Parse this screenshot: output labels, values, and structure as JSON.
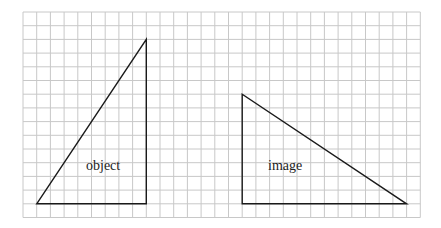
{
  "diagram": {
    "grid": {
      "origin_x": 23,
      "origin_y": 12,
      "cell": 13.7,
      "cols": 29,
      "rows": 15,
      "line_color": "#c8c8c8"
    },
    "shapes": [
      {
        "name": "object",
        "label": "object",
        "vertices_grid": [
          [
            1,
            14
          ],
          [
            9,
            2
          ],
          [
            9,
            14
          ]
        ],
        "label_pos": [
          86,
          170
        ]
      },
      {
        "name": "image",
        "label": "image",
        "vertices_grid": [
          [
            16,
            6
          ],
          [
            16,
            14
          ],
          [
            28,
            14
          ]
        ],
        "label_pos": [
          268,
          170
        ]
      }
    ],
    "stroke_color": "#1a1a1a"
  }
}
